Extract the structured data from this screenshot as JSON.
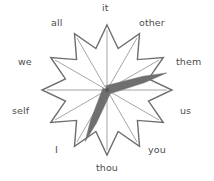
{
  "figure": {
    "title": "",
    "type": "radar-clock-diagram",
    "background_color": "#ffffff",
    "outline_color": "#6e6e6e",
    "spoke_color": "#5a5a5a",
    "hand_color": "#6f6f6f",
    "label_color": "#4d4d4d"
  },
  "chart_data": {
    "type": "radar",
    "title": "",
    "xlabel": "",
    "ylabel": "",
    "grid": false,
    "legend": "none",
    "center": {
      "x": 107,
      "y": 90
    },
    "outer_radius": 65,
    "inner_radius": 43,
    "n_points": 12,
    "categories": [
      "it",
      "other",
      "them",
      "us",
      "you",
      "thou",
      "I",
      "self",
      "we",
      "all",
      "it-top",
      "other-top"
    ],
    "axes": [
      {
        "label": "it",
        "angle_deg": 90,
        "index": 0,
        "label_x": 100,
        "label_y": 4
      },
      {
        "label": "other",
        "angle_deg": 60,
        "index": 1,
        "label_x": 138,
        "label_y": 20
      },
      {
        "label": "them",
        "angle_deg": 30,
        "index": 2,
        "label_x": 173,
        "label_y": 60
      },
      {
        "label": "us",
        "angle_deg": 0,
        "index": 3,
        "label_x": 182,
        "label_y": 108
      },
      {
        "label": "you",
        "angle_deg": -30,
        "index": 4,
        "label_x": 146,
        "label_y": 145
      },
      {
        "label": "thou",
        "angle_deg": -60,
        "index": 5,
        "label_x": 96,
        "label_y": 163
      },
      {
        "label": "I",
        "angle_deg": -90,
        "index": 6,
        "label_x": 54,
        "label_y": 145
      },
      {
        "label": "self",
        "angle_deg": -120,
        "index": 7,
        "label_x": 11,
        "label_y": 108
      },
      {
        "label": "we",
        "angle_deg": 180,
        "index": 8,
        "label_x": 19,
        "label_y": 60
      },
      {
        "label": "all",
        "angle_deg": 120,
        "index": 9,
        "label_x": 50,
        "label_y": 20
      }
    ],
    "hands": [
      {
        "name": "long-hand",
        "points_toward": "them",
        "angle_deg": 16,
        "length": 62,
        "base_width": 9
      },
      {
        "name": "short-hand",
        "points_toward": "I",
        "angle_deg": -113,
        "length": 56,
        "base_width": 9
      }
    ],
    "spokes": {
      "count": 12,
      "radius": 60,
      "description": "thin radial lines from center to each of the 12 star points"
    }
  },
  "labels": {
    "it": "it",
    "other": "other",
    "them": "them",
    "us": "us",
    "you": "you",
    "thou": "thou",
    "i": "I",
    "self": "self",
    "we": "we",
    "all": "all"
  }
}
